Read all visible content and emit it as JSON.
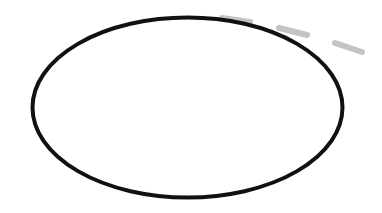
{
  "canvas": {
    "width": 382,
    "height": 213,
    "background": "#ffffff"
  },
  "ellipse": {
    "cx": 187.5,
    "cy": 107.5,
    "rx": 155,
    "ry": 90,
    "stroke": "#111111",
    "stroke_width": 4
  },
  "dashes": {
    "color": "#c4c4c4",
    "width": 6,
    "segments": [
      {
        "x1": 222,
        "y1": 18,
        "x2": 250,
        "y2": 22
      },
      {
        "x1": 279,
        "y1": 28,
        "x2": 307,
        "y2": 35
      },
      {
        "x1": 335,
        "y1": 43,
        "x2": 362,
        "y2": 52
      }
    ]
  }
}
